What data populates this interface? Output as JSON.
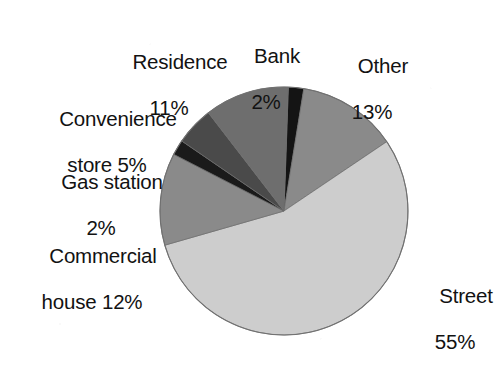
{
  "chart_data": {
    "type": "pie",
    "title": "",
    "subtitle": "",
    "xlabel": "",
    "ylabel": "",
    "legend_position": "none",
    "grid": false,
    "units": "percent",
    "total": 100,
    "labels": [
      "Bank",
      "Other",
      "Street",
      "Commercial house",
      "Gas station",
      "Convenience store",
      "Residence"
    ],
    "values": [
      2,
      13,
      55,
      12,
      2,
      5,
      11
    ],
    "colors": [
      "#141414",
      "#8a8a8a",
      "#cdcdcd",
      "#8a8a8a",
      "#1a1a1a",
      "#4a4a4a",
      "#6e6e6e"
    ],
    "start_angle_deg": -88,
    "direction": "clockwise",
    "slices": [
      {
        "name": "Bank",
        "value": 2,
        "color": "#141414",
        "label_line1": "Bank",
        "label_line2": "2%"
      },
      {
        "name": "Other",
        "value": 13,
        "color": "#8a8a8a",
        "label_line1": "Other",
        "label_line2": "13%"
      },
      {
        "name": "Street",
        "value": 55,
        "color": "#cdcdcd",
        "label_line1": "Street",
        "label_line2": "55%"
      },
      {
        "name": "Commercial house",
        "value": 12,
        "color": "#8a8a8a",
        "label_line1": "Commercial",
        "label_line2": "house 12%"
      },
      {
        "name": "Gas station",
        "value": 2,
        "color": "#1a1a1a",
        "label_line1": "Gas station",
        "label_line2": "2%"
      },
      {
        "name": "Convenience store",
        "value": 5,
        "color": "#4a4a4a",
        "label_line1": "Convenience",
        "label_line2": "store 5%"
      },
      {
        "name": "Residence",
        "value": 11,
        "color": "#6e6e6e",
        "label_line1": "Residence",
        "label_line2": "11%"
      }
    ]
  },
  "geometry": {
    "center_x": 284,
    "center_y": 211,
    "radius": 124
  },
  "labels": {
    "residence": {
      "line1": "Residence",
      "line2": "11%"
    },
    "bank": {
      "line1": "Bank",
      "line2": "2%"
    },
    "other": {
      "line1": "Other",
      "line2": "13%"
    },
    "convenience": {
      "line1": "Convenience",
      "line2": "store 5%"
    },
    "gas": {
      "line1": "Gas station",
      "line2": "2%"
    },
    "commercial": {
      "line1": "Commercial",
      "line2": "house 12%"
    },
    "street": {
      "line1": "Street",
      "line2": "55%"
    }
  }
}
